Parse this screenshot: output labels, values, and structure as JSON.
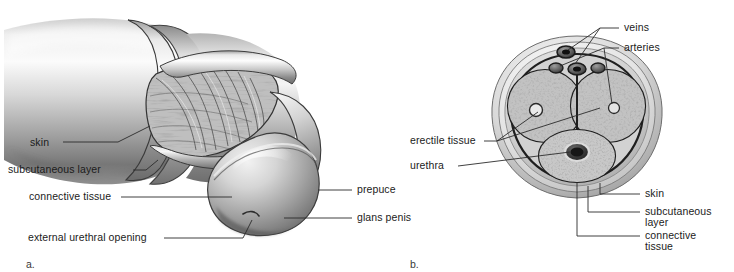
{
  "figure": {
    "background_color": "#ffffff",
    "ink_color": "#1b1b1b",
    "leader_color": "#2b2b2b",
    "panels": [
      {
        "id": "a",
        "letter": "a."
      },
      {
        "id": "b",
        "letter": "b."
      }
    ]
  },
  "panel_a": {
    "letter": "a.",
    "title": "",
    "labels": {
      "skin": "skin",
      "subcutaneous_layer": "subcutaneous layer",
      "connective_tissue": "connective tissue",
      "external_urethral_opening": "external urethral opening",
      "prepuce": "prepuce",
      "glans_penis": "glans penis"
    }
  },
  "panel_b": {
    "letter": "b.",
    "title": "",
    "labels": {
      "veins": "veins",
      "arteries": "arteries",
      "erectile_tissue": "erectile tissue",
      "urethra": "urethra",
      "skin": "skin",
      "subcutaneous_layer_line1": "subcutaneous",
      "subcutaneous_layer_line2": "layer",
      "connective_tissue_line1": "connective",
      "connective_tissue_line2": "tissue"
    }
  }
}
